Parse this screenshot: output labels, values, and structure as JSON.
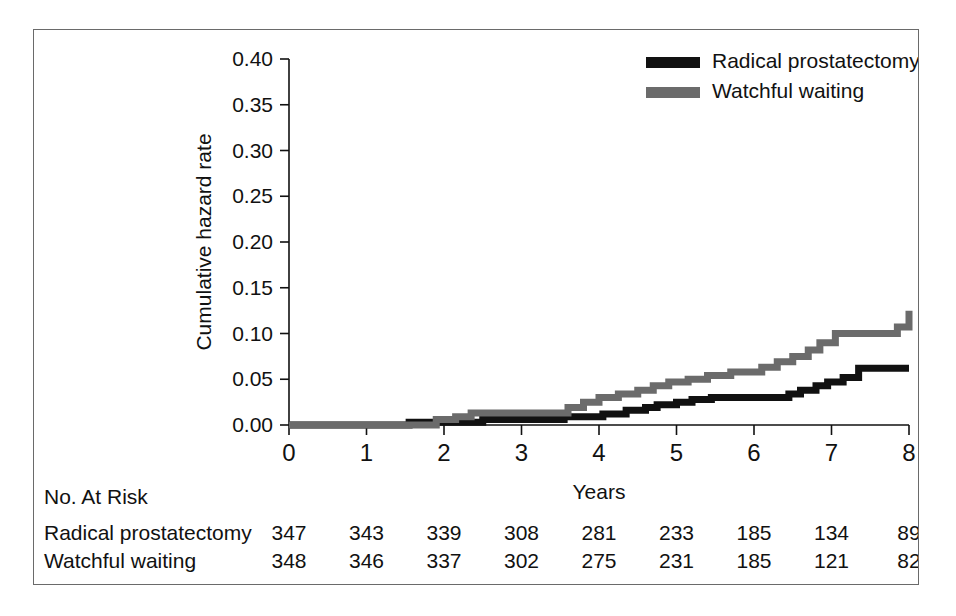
{
  "figure": {
    "frame_color": "#6a6a6a",
    "background": "#ffffff"
  },
  "legend": {
    "position": "top-right",
    "entries": [
      {
        "label": "Radical prostatectomy",
        "color": "#111111"
      },
      {
        "label": "Watchful waiting",
        "color": "#6b6b6b"
      }
    ]
  },
  "risk_table": {
    "header": "No. At Risk",
    "rows": [
      {
        "label": "Radical prostatectomy",
        "values": [
          "347",
          "343",
          "339",
          "308",
          "281",
          "233",
          "185",
          "134",
          "89"
        ]
      },
      {
        "label": "Watchful waiting",
        "values": [
          "348",
          "346",
          "337",
          "302",
          "275",
          "231",
          "185",
          "121",
          "82"
        ]
      }
    ]
  },
  "chart_data": {
    "type": "line",
    "title": "",
    "xlabel": "Years",
    "ylabel": "Cumulative hazard rate",
    "xlim": [
      0,
      8
    ],
    "ylim": [
      0,
      0.4
    ],
    "xticks": [
      "0",
      "1",
      "2",
      "3",
      "4",
      "5",
      "6",
      "7",
      "8"
    ],
    "xtick_values": [
      0,
      1,
      2,
      3,
      4,
      5,
      6,
      7,
      8
    ],
    "yticks": [
      "0.00",
      "0.05",
      "0.10",
      "0.15",
      "0.20",
      "0.25",
      "0.30",
      "0.35",
      "0.40"
    ],
    "ytick_values": [
      0,
      0.05,
      0.1,
      0.15,
      0.2,
      0.25,
      0.3,
      0.35,
      0.4
    ],
    "grid": false,
    "step_style": "post",
    "legend_position": "upper right",
    "series": [
      {
        "name": "Radical prostatectomy",
        "color": "#111111",
        "x": [
          0.0,
          1.35,
          1.55,
          2.1,
          2.5,
          3.3,
          3.55,
          3.75,
          4.05,
          4.35,
          4.6,
          4.75,
          5.0,
          5.2,
          5.45,
          6.2,
          6.45,
          6.6,
          6.8,
          6.95,
          7.15,
          7.35,
          8.0
        ],
        "values": [
          0.0,
          0.0,
          0.003,
          0.003,
          0.006,
          0.006,
          0.009,
          0.009,
          0.012,
          0.016,
          0.019,
          0.022,
          0.025,
          0.028,
          0.03,
          0.03,
          0.034,
          0.038,
          0.043,
          0.047,
          0.052,
          0.062,
          0.062
        ]
      },
      {
        "name": "Watchful waiting",
        "color": "#6b6b6b",
        "x": [
          0.0,
          1.4,
          1.9,
          2.15,
          2.35,
          2.6,
          3.45,
          3.6,
          3.8,
          4.0,
          4.25,
          4.5,
          4.7,
          4.9,
          5.15,
          5.4,
          5.7,
          6.1,
          6.3,
          6.5,
          6.7,
          6.85,
          7.05,
          7.6,
          7.85,
          8.0
        ],
        "values": [
          0.0,
          0.0,
          0.006,
          0.009,
          0.013,
          0.013,
          0.013,
          0.019,
          0.025,
          0.03,
          0.034,
          0.038,
          0.043,
          0.047,
          0.05,
          0.054,
          0.058,
          0.063,
          0.069,
          0.075,
          0.082,
          0.09,
          0.1,
          0.1,
          0.107,
          0.125
        ]
      }
    ]
  }
}
